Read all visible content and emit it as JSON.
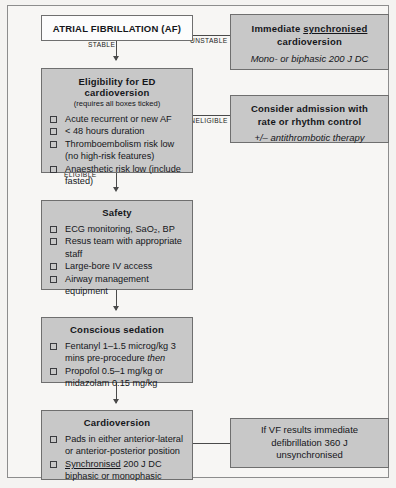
{
  "diagram": {
    "colors": {
      "box_fill": "#c8c8c8",
      "box_fill_white": "#fcfcfc",
      "box_border": "#6f6f6f",
      "line": "#4a4a4a",
      "page_background": "#f4f3f1",
      "text": "#15161a"
    }
  },
  "nodes": {
    "af": {
      "title": "ATRIAL FIBRILLATION (AF)"
    },
    "immediate_cardioversion": {
      "title_pre": "Immediate ",
      "title_underlined": "synchronised",
      "title_line2": "cardioversion",
      "subtitle": "Mono- or biphasic 200 J DC"
    },
    "eligibility": {
      "title": "Eligibility for ED cardioversion",
      "subtitle": "(requires all boxes ticked)",
      "items": [
        "Acute recurrent or new AF",
        "< 48 hours duration",
        "Thromboembolism risk low (no high-risk features)",
        "Anaesthetic risk low (include fasted)"
      ]
    },
    "consider_admission": {
      "title_line1": "Consider admission with",
      "title_line2": "rate or rhythm control",
      "subtitle": "+/– antithrombotic therapy"
    },
    "safety": {
      "title": "Safety",
      "items": [
        "ECG monitoring, SaO₂, BP",
        "Resus team with appropriate staff",
        "Large-bore IV access",
        "Airway management equipment"
      ]
    },
    "conscious_sedation": {
      "title": "Conscious sedation",
      "item1_pre": "Fentanyl 1–1.5 microg/kg 3 mins pre-procedure ",
      "item1_italic": "then",
      "item2": "Propofol 0.5–1 mg/kg or midazolam 0.15 mg/kg"
    },
    "cardioversion": {
      "title": "Cardioversion",
      "item1": "Pads in either anterior-lateral or anterior-posterior position",
      "item2_underlined": "Synchronised",
      "item2_rest": " 200 J DC biphasic or monophasic"
    },
    "vf_result": {
      "line1": "If VF results immediate",
      "line2": "defibrillation 360 J",
      "line3": "unsynchronised"
    }
  },
  "edges": {
    "unstable": "UNSTABLE",
    "stable": "STABLE",
    "ineligible": "INELIGIBLE",
    "eligible": "ELIGIBLE"
  }
}
